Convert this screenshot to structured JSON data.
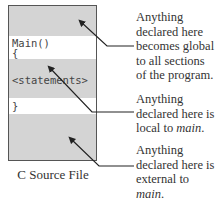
{
  "diagram": {
    "caption": "C Source File",
    "code": {
      "main_decl": "Main()",
      "open_brace": "{",
      "statements": "<statements>",
      "close_brace": "}"
    },
    "annotations": [
      {
        "id": "global",
        "lines": [
          "Anything",
          "declared here",
          "becomes global",
          "to all sections",
          "of the program."
        ]
      },
      {
        "id": "local",
        "lines": [
          "Anything",
          "declared here is",
          "local to "
        ],
        "emph": "main",
        "suffix": "."
      },
      {
        "id": "external",
        "lines": [
          "Anything",
          "declared here is",
          "external to"
        ],
        "emph": "main",
        "suffix": "."
      }
    ],
    "colors": {
      "gray_band": "#d4d4d4",
      "white_band": "#ffffff",
      "border": "#555555",
      "text": "#333333"
    }
  }
}
